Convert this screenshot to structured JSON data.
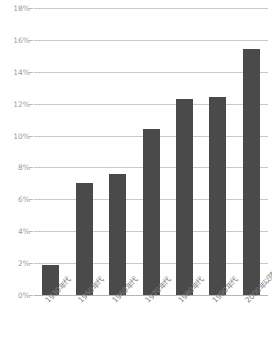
{
  "chart_data": {
    "type": "bar",
    "title": "",
    "subtitle": "",
    "xlabel": "",
    "ylabel": "",
    "categories": [
      "1930年代",
      "1950年代",
      "1960年代",
      "1970年代",
      "1980年代",
      "1990年代",
      "2000年以降"
    ],
    "values": [
      1.9,
      7.0,
      7.6,
      10.4,
      12.3,
      12.4,
      15.4
    ],
    "value_labels": [
      "1.9%",
      "7.0%",
      "7.6%",
      "10.4%",
      "12.3%",
      "12.4%",
      "15.4%"
    ],
    "ylim": [
      0,
      18
    ],
    "ytick_values": [
      0,
      2,
      4,
      6,
      8,
      10,
      12,
      14,
      16,
      18
    ],
    "ytick_labels": [
      "0%",
      "2%",
      "4%",
      "6%",
      "8%",
      "10%",
      "12%",
      "14%",
      "16%",
      "18%"
    ],
    "grid": true,
    "legend": null,
    "legend_position": "none",
    "annotations": [],
    "colors": {
      "bar": "#4a4a4a",
      "gridline": "#c9c9c9",
      "baseline": "#b5b5b5",
      "tick_label": "#9b9b9b",
      "category_label": "#7d7d7d",
      "background": "#ffffff"
    }
  }
}
